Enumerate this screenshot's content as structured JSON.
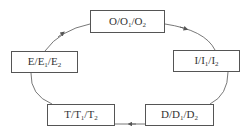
{
  "diagram": {
    "type": "cycle",
    "nodes": [
      {
        "id": "O",
        "main": "O",
        "sub1": "O",
        "sub2": "O",
        "box": {
          "x": 90,
          "y": 10,
          "w": 75,
          "h": 23
        }
      },
      {
        "id": "I",
        "main": "I",
        "sub1": "I",
        "sub2": "I",
        "box": {
          "x": 173,
          "y": 50,
          "w": 67,
          "h": 22
        }
      },
      {
        "id": "D",
        "main": "D",
        "sub1": "D",
        "sub2": "D",
        "box": {
          "x": 145,
          "y": 104,
          "w": 69,
          "h": 22
        }
      },
      {
        "id": "T",
        "main": "T",
        "sub1": "T",
        "sub2": "T",
        "box": {
          "x": 47,
          "y": 104,
          "w": 68,
          "h": 22
        }
      },
      {
        "id": "E",
        "main": "E",
        "sub1": "E",
        "sub2": "E",
        "box": {
          "x": 11,
          "y": 51,
          "w": 67,
          "h": 22
        }
      }
    ],
    "edges": [
      {
        "from": "O",
        "to": "I",
        "arrow": "mid"
      },
      {
        "from": "I",
        "to": "D",
        "arrow": "none"
      },
      {
        "from": "D",
        "to": "T",
        "arrow": "mid"
      },
      {
        "from": "T",
        "to": "E",
        "arrow": "none"
      },
      {
        "from": "E",
        "to": "O",
        "arrow": "mid"
      }
    ],
    "sub_labels": [
      "1",
      "2"
    ],
    "colors": {
      "line": "#555555",
      "text": "#333333"
    }
  }
}
